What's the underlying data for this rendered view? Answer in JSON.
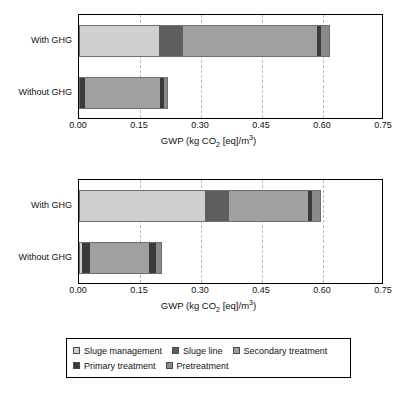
{
  "axis": {
    "title_main": "GWP (kg CO",
    "title_sub": "2",
    "title_rest": " [eq]/m",
    "title_sup": "3",
    "title_close": ")",
    "ticks": [
      "0.00",
      "0.15",
      "0.30",
      "0.45",
      "0.60",
      "0.75"
    ]
  },
  "categories": [
    "With GHG",
    "Without GHG"
  ],
  "legend": {
    "items": [
      {
        "label": "Sluge management",
        "color": "#cfcfcf"
      },
      {
        "label": "Sluge line",
        "color": "#5e5e5e"
      },
      {
        "label": "Secondary treatment",
        "color": "#a0a0a0"
      },
      {
        "label": "Primary treatment",
        "color": "#3a3a3a"
      },
      {
        "label": "Pretreatment",
        "color": "#8a8a8a"
      }
    ]
  },
  "chart_data": [
    {
      "type": "bar",
      "orientation": "horizontal",
      "stacked": true,
      "title": "",
      "xlabel": "GWP (kg CO2 [eq]/m3)",
      "ylabel": "",
      "xlim": [
        0.0,
        0.75
      ],
      "xticks": [
        0.0,
        0.15,
        0.3,
        0.45,
        0.6,
        0.75
      ],
      "grid": "vertical-dashed",
      "legend_position": "below-figure",
      "categories": [
        "With GHG",
        "Without GHG"
      ],
      "series": [
        {
          "name": "Pretreatment",
          "color": "#8a8a8a",
          "values": [
            0.0,
            0.0
          ]
        },
        {
          "name": "Primary treatment",
          "color": "#3a3a3a",
          "values": [
            0.0,
            0.015
          ]
        },
        {
          "name": "Sluge management",
          "color": "#cfcfcf",
          "values": [
            0.197,
            0.0
          ]
        },
        {
          "name": "Sluge line",
          "color": "#5e5e5e",
          "values": [
            0.059,
            0.0
          ]
        },
        {
          "name": "Secondary treatment",
          "color": "#a0a0a0",
          "values": [
            0.33,
            0.185
          ]
        },
        {
          "name": "Primary treatment 2",
          "color": "#3a3a3a",
          "values": [
            0.01,
            0.01
          ]
        },
        {
          "name": "Pretreatment 2",
          "color": "#8a8a8a",
          "values": [
            0.022,
            0.009
          ]
        }
      ],
      "totals": [
        0.618,
        0.219
      ]
    },
    {
      "type": "bar",
      "orientation": "horizontal",
      "stacked": true,
      "title": "",
      "xlabel": "GWP (kg CO2 [eq]/m3)",
      "ylabel": "",
      "xlim": [
        0.0,
        0.75
      ],
      "xticks": [
        0.0,
        0.15,
        0.3,
        0.45,
        0.6,
        0.75
      ],
      "grid": "vertical-dashed",
      "legend_position": "below-figure",
      "categories": [
        "With GHG",
        "Without GHG"
      ],
      "series": [
        {
          "name": "Sluge management",
          "color": "#cfcfcf",
          "values": [
            0.31,
            0.007
          ]
        },
        {
          "name": "Primary treatment",
          "color": "#3a3a3a",
          "values": [
            0.0,
            0.02
          ]
        },
        {
          "name": "Sluge line",
          "color": "#5e5e5e",
          "values": [
            0.059,
            0.0
          ]
        },
        {
          "name": "Secondary treatment",
          "color": "#a0a0a0",
          "values": [
            0.194,
            0.145
          ]
        },
        {
          "name": "Primary treatment 2",
          "color": "#3a3a3a",
          "values": [
            0.01,
            0.017
          ]
        },
        {
          "name": "Pretreatment 2",
          "color": "#8a8a8a",
          "values": [
            0.022,
            0.015
          ]
        }
      ],
      "totals": [
        0.595,
        0.204
      ]
    }
  ],
  "panels": [
    {
      "bars": [
        {
          "category": "With GHG",
          "segments": [
            {
              "name": "Sluge management",
              "color": "#cfcfcf",
              "start": 0.0,
              "end": 0.197
            },
            {
              "name": "Sluge line",
              "color": "#5e5e5e",
              "start": 0.197,
              "end": 0.256
            },
            {
              "name": "Secondary treatment",
              "color": "#a0a0a0",
              "start": 0.256,
              "end": 0.586
            },
            {
              "name": "Primary treatment",
              "color": "#3a3a3a",
              "start": 0.586,
              "end": 0.596
            },
            {
              "name": "Pretreatment",
              "color": "#8a8a8a",
              "start": 0.596,
              "end": 0.618
            }
          ]
        },
        {
          "category": "Without GHG",
          "segments": [
            {
              "name": "Primary treatment",
              "color": "#3a3a3a",
              "start": 0.0,
              "end": 0.015
            },
            {
              "name": "Secondary treatment",
              "color": "#a0a0a0",
              "start": 0.015,
              "end": 0.2
            },
            {
              "name": "Primary treatment",
              "color": "#3a3a3a",
              "start": 0.2,
              "end": 0.21
            },
            {
              "name": "Pretreatment",
              "color": "#8a8a8a",
              "start": 0.21,
              "end": 0.219
            }
          ]
        }
      ]
    },
    {
      "bars": [
        {
          "category": "With GHG",
          "segments": [
            {
              "name": "Sluge management",
              "color": "#cfcfcf",
              "start": 0.0,
              "end": 0.31
            },
            {
              "name": "Sluge line",
              "color": "#5e5e5e",
              "start": 0.31,
              "end": 0.369
            },
            {
              "name": "Secondary treatment",
              "color": "#a0a0a0",
              "start": 0.369,
              "end": 0.563
            },
            {
              "name": "Primary treatment",
              "color": "#3a3a3a",
              "start": 0.563,
              "end": 0.573
            },
            {
              "name": "Pretreatment",
              "color": "#8a8a8a",
              "start": 0.573,
              "end": 0.595
            }
          ]
        },
        {
          "category": "Without GHG",
          "segments": [
            {
              "name": "Sluge management",
              "color": "#cfcfcf",
              "start": 0.0,
              "end": 0.007
            },
            {
              "name": "Primary treatment",
              "color": "#3a3a3a",
              "start": 0.007,
              "end": 0.027
            },
            {
              "name": "Secondary treatment",
              "color": "#a0a0a0",
              "start": 0.027,
              "end": 0.172
            },
            {
              "name": "Primary treatment",
              "color": "#3a3a3a",
              "start": 0.172,
              "end": 0.189
            },
            {
              "name": "Pretreatment",
              "color": "#8a8a8a",
              "start": 0.189,
              "end": 0.204
            }
          ]
        }
      ]
    }
  ]
}
